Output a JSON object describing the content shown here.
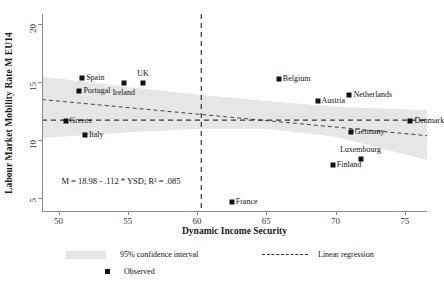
{
  "chart_data": {
    "type": "scatter",
    "title": "",
    "xlabel": "Dynamic Income Security",
    "ylabel": "Labour Market Mobility Rate M EU14",
    "xlim": [
      48.8,
      76.6
    ],
    "ylim": [
      3.9,
      20.9
    ],
    "xticks": [
      50,
      55,
      60,
      65,
      70,
      75
    ],
    "yticks": [
      5,
      10,
      15,
      20
    ],
    "grid": false,
    "annotation": "M = 18.98 - .112 * YSD; R² = .085",
    "regression": {
      "intercept": 18.98,
      "slope": -0.112,
      "r_squared": 0.085,
      "x_start": 48.8,
      "x_end": 76.6,
      "y_start": 13.52,
      "y_end": 10.4
    },
    "reference_lines": {
      "vertical_x": 60.3,
      "horizontal_y": 11.75
    },
    "confidence_interval": {
      "level": "95%",
      "x": [
        48.8,
        55.0,
        60.3,
        65.0,
        70.0,
        76.6
      ],
      "upper": [
        15.5,
        14.6,
        13.9,
        13.4,
        12.9,
        12.6
      ],
      "lower": [
        10.2,
        10.7,
        11.0,
        11.0,
        10.3,
        8.3
      ]
    },
    "points": [
      {
        "label": "Spain",
        "x": 51.7,
        "y": 15.35,
        "label_pos": "right"
      },
      {
        "label": "Portugal",
        "x": 51.5,
        "y": 14.25,
        "label_pos": "right"
      },
      {
        "label": "Ireland",
        "x": 54.7,
        "y": 14.95,
        "label_pos": "below"
      },
      {
        "label": "UK",
        "x": 56.1,
        "y": 14.95,
        "label_pos": "above"
      },
      {
        "label": "Greece",
        "x": 50.5,
        "y": 11.65,
        "label_pos": "right"
      },
      {
        "label": "Italy",
        "x": 51.9,
        "y": 10.45,
        "label_pos": "right"
      },
      {
        "label": "Belgium",
        "x": 65.9,
        "y": 15.3,
        "label_pos": "right"
      },
      {
        "label": "Netherlands",
        "x": 71.0,
        "y": 13.9,
        "label_pos": "right"
      },
      {
        "label": "Austria",
        "x": 68.7,
        "y": 13.35,
        "label_pos": "right"
      },
      {
        "label": "Denmark",
        "x": 75.4,
        "y": 11.7,
        "label_pos": "right"
      },
      {
        "label": "Germany",
        "x": 71.1,
        "y": 10.75,
        "label_pos": "right"
      },
      {
        "label": "Luxembourg",
        "x": 71.8,
        "y": 8.35,
        "label_pos": "above"
      },
      {
        "label": "Finland",
        "x": 69.8,
        "y": 7.85,
        "label_pos": "right"
      },
      {
        "label": "France",
        "x": 62.5,
        "y": 4.65,
        "label_pos": "right"
      }
    ],
    "legend": {
      "position": "bottom",
      "entries": [
        {
          "name": "ci-band",
          "label": "95% confidence interval"
        },
        {
          "name": "regression",
          "label": "Linear regression"
        },
        {
          "name": "observed",
          "label": "Observed"
        }
      ]
    }
  },
  "colors": {
    "marker": "#111111",
    "band": "#e6e6e6",
    "axis": "#8a8a8a",
    "reference_line": "#333333"
  }
}
